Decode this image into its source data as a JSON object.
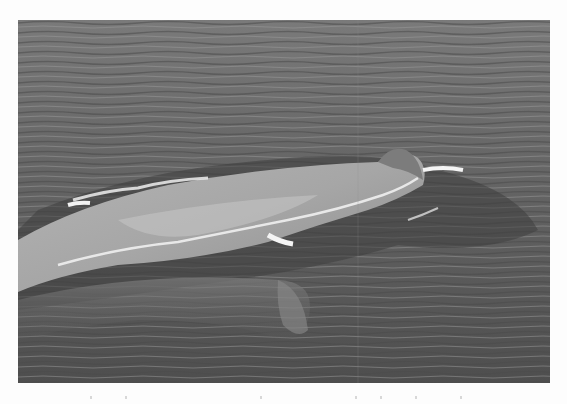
{
  "image": {
    "subject": "Whale surfacing in open ocean water",
    "alt": "Grayscale photograph of a large whale's back breaking the surface of rippled sea water",
    "mode": "grayscale",
    "frame": {
      "x": 18,
      "y": 20,
      "width": 532,
      "height": 363
    }
  },
  "palette": {
    "page_background": "#fdfdfd",
    "water_dark": "#3a3a3a",
    "water_mid": "#6e6e6e",
    "water_light": "#9a9a9a",
    "whale_body": "#a8a8a8",
    "whale_highlight": "#c8c8c8",
    "foam": "#efefef"
  }
}
